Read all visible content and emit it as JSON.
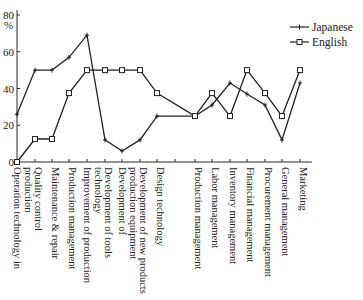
{
  "chart_data": {
    "type": "line",
    "title": "",
    "xlabel": "",
    "ylabel": "%",
    "ylim": [
      0,
      80
    ],
    "yticks": [
      0,
      20,
      40,
      60,
      80
    ],
    "grid": false,
    "legend_position": "top-right",
    "categories": [
      "Operation technology in production",
      "Quality control",
      "Maintenance & repair",
      "Production management",
      "Improvement of production technology",
      "Development of tools",
      "Development of production equipment",
      "Development of new products",
      "Design technology",
      "",
      "Production management",
      "Labor management",
      "Inventory management",
      "Financial management",
      "Procurement management",
      "General management",
      "Marketing"
    ],
    "category_label_lines": [
      [
        "Operation technology in",
        "production"
      ],
      [
        "Quality control"
      ],
      [
        "Maintenance & repair"
      ],
      [
        "Production management"
      ],
      [
        "Improvement of production",
        "technology"
      ],
      [
        "Development of tools"
      ],
      [
        "Development of",
        "production equipment"
      ],
      [
        "Development of new products"
      ],
      [
        "Design technology"
      ],
      [],
      [
        "Production management"
      ],
      [
        "Labor management"
      ],
      [
        "Inventory management"
      ],
      [
        "Financial management"
      ],
      [
        "Procurement management"
      ],
      [
        "General management"
      ],
      [
        "Marketing"
      ]
    ],
    "series": [
      {
        "name": "Japanese",
        "marker": "plus",
        "values": [
          26,
          50,
          50,
          57,
          69,
          12,
          6,
          12,
          25,
          null,
          25,
          31,
          43,
          37,
          31,
          12,
          43
        ]
      },
      {
        "name": "English",
        "marker": "square",
        "values": [
          0,
          12.5,
          12.5,
          37.5,
          50,
          50,
          50,
          50,
          37.5,
          null,
          25,
          37.5,
          25,
          50,
          37.5,
          25,
          50
        ]
      }
    ]
  },
  "axis": {
    "y_unit_label": "%",
    "y_tick_labels": [
      "0",
      "20",
      "40",
      "60",
      "80"
    ]
  },
  "legend": {
    "items": [
      {
        "label": "Japanese",
        "marker": "plus"
      },
      {
        "label": "English",
        "marker": "square"
      }
    ]
  }
}
